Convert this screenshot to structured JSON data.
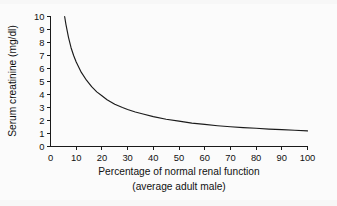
{
  "figure": {
    "background_color": "#f7f7f7",
    "plot_background_color": "#fbfbfb",
    "ink_color": "#1a1a1a"
  },
  "chart_data": {
    "type": "line",
    "title": "",
    "subtitle": "",
    "xlabel": "Percentage of normal renal function",
    "xlabel_line2": "(average adult male)",
    "ylabel": "Serum creatinine (mg/dl)",
    "xlim": [
      0,
      100
    ],
    "ylim": [
      0,
      10
    ],
    "xticks": [
      0,
      10,
      20,
      30,
      40,
      50,
      60,
      70,
      80,
      90,
      100
    ],
    "xtick_labels": [
      "0",
      "10",
      "20",
      "30",
      "40",
      "50",
      "60",
      "70",
      "80",
      "90",
      "100"
    ],
    "yticks": [
      0,
      1,
      2,
      3,
      4,
      5,
      6,
      7,
      8,
      9,
      10
    ],
    "ytick_labels": [
      "0",
      "1",
      "2",
      "3",
      "4",
      "5",
      "6",
      "7",
      "8",
      "9",
      "10"
    ],
    "grid": false,
    "legend": false,
    "legend_position": "none",
    "series": [
      {
        "name": "Serum creatinine",
        "x": [
          5.5,
          6,
          7,
          8,
          9,
          10,
          12,
          14,
          16,
          18,
          20,
          22,
          25,
          28,
          30,
          33,
          36,
          40,
          45,
          50,
          55,
          60,
          65,
          70,
          75,
          80,
          85,
          90,
          95,
          100
        ],
        "y": [
          10.0,
          9.4,
          8.4,
          7.6,
          7.0,
          6.5,
          5.7,
          5.1,
          4.6,
          4.2,
          3.9,
          3.6,
          3.25,
          3.0,
          2.85,
          2.65,
          2.5,
          2.3,
          2.1,
          1.95,
          1.8,
          1.7,
          1.6,
          1.52,
          1.45,
          1.4,
          1.34,
          1.3,
          1.25,
          1.2
        ]
      }
    ],
    "annotations": []
  }
}
